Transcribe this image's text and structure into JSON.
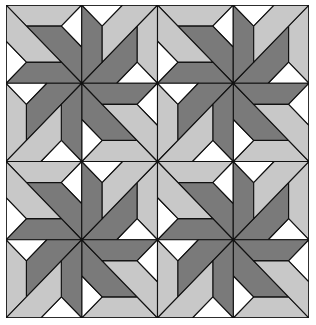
{
  "pattern": {
    "grid_blocks": [
      2,
      2
    ],
    "subsquares_per_block": [
      2,
      2
    ],
    "block_rotations_deg": [
      0,
      90,
      180,
      270
    ]
  },
  "colors": {
    "light": "#c8c8c8",
    "dark": "#7a7a7a",
    "white": "#ffffff",
    "line": "#111111"
  }
}
